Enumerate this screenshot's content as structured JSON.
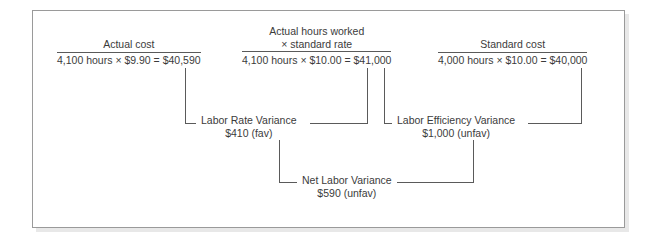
{
  "diagram": {
    "title_note": "Labor variance analysis diagram",
    "columns": [
      {
        "id": "actual-cost",
        "heading": "Actual cost",
        "formula": "4,100 hours × $9.90 = $40,590"
      },
      {
        "id": "actual-hours-standard-rate",
        "heading_line1": "Actual hours worked",
        "heading_line2": "× standard rate",
        "formula": "4,100 hours × $10.00 = $41,000"
      },
      {
        "id": "standard-cost",
        "heading": "Standard cost",
        "formula": "4,000 hours × $10.00 = $40,000"
      }
    ],
    "variances": [
      {
        "id": "labor-rate-variance",
        "name": "Labor Rate Variance",
        "amount": "$410 (fav)"
      },
      {
        "id": "labor-efficiency-variance",
        "name": "Labor Efficiency Variance",
        "amount": "$1,000 (unfav)"
      },
      {
        "id": "net-labor-variance",
        "name": "Net Labor Variance",
        "amount": "$590 (unfav)"
      }
    ],
    "colors": {
      "line": "#5a5a5a",
      "text": "#3b3b3b",
      "border": "#9a9a9a",
      "background": "#ffffff"
    }
  }
}
